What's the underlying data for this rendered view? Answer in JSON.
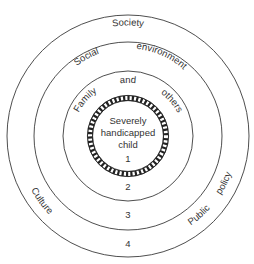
{
  "diagram": {
    "type": "concentric-circles",
    "center": {
      "x": 128,
      "y": 136
    },
    "rings": [
      {
        "level": 1,
        "label": "Severely handicapped child",
        "radius": 38,
        "style": "hatched",
        "number": "1"
      },
      {
        "level": 2,
        "label": "Family and others",
        "radius": 65,
        "number": "2"
      },
      {
        "level": 3,
        "label": "Social environment",
        "radius": 94,
        "number": "3"
      },
      {
        "level": 4,
        "label": "Society",
        "radius": 121,
        "number": "4"
      }
    ],
    "labels": {
      "society": "Society",
      "social": "Social",
      "environment": "environment",
      "family": "Family",
      "and": "and",
      "others": "others",
      "center_line1": "Severely",
      "center_line2": "handicapped",
      "center_line3": "child",
      "culture": "Culture",
      "public": "Public",
      "policy": "policy"
    },
    "numbers": {
      "n1": "1",
      "n2": "2",
      "n3": "3",
      "n4": "4"
    },
    "colors": {
      "line": "#3a3a3a",
      "text": "#333333",
      "background": "#ffffff"
    }
  }
}
